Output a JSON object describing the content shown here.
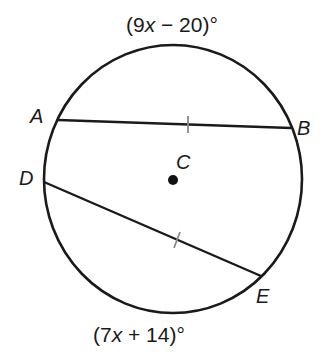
{
  "diagram": {
    "circle": {
      "center_label": "C",
      "cx": 173,
      "cy": 179,
      "rx": 129,
      "ry": 134
    },
    "points": {
      "A": {
        "label": "A",
        "x": 58,
        "y": 120
      },
      "B": {
        "label": "B",
        "x": 291,
        "y": 128
      },
      "D": {
        "label": "D",
        "x": 44,
        "y": 182
      },
      "E": {
        "label": "E",
        "x": 261,
        "y": 276
      },
      "C": {
        "label": "C",
        "x": 173,
        "y": 180
      }
    },
    "chords": [
      {
        "name": "AB",
        "from": "A",
        "to": "B",
        "congruence_tick": true
      },
      {
        "name": "DE",
        "from": "D",
        "to": "E",
        "congruence_tick": true
      }
    ],
    "arc_labels": {
      "top": {
        "open": "(9",
        "var": "x",
        "rest": " − 20)°"
      },
      "bottom": {
        "open": "(7",
        "var": "x",
        "rest": " + 14)°"
      }
    },
    "colors": {
      "stroke": "#1a1a1a",
      "tick": "#8a8a8a",
      "background": "#ffffff"
    }
  }
}
